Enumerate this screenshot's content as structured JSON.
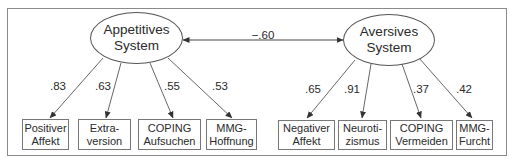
{
  "diagram": {
    "type": "structural-equation-model",
    "correlation": {
      "label": "−.60",
      "between": [
        "Appetitives System",
        "Aversives System"
      ]
    },
    "latents": [
      {
        "name": "Appetitives System",
        "line1": "Appetitives",
        "line2": "System",
        "indicators": [
          {
            "line1": "Positiver",
            "line2": "Affekt",
            "loading": ".83"
          },
          {
            "line1": "Extra-",
            "line2": "version",
            "loading": ".63"
          },
          {
            "line1": "COPING",
            "line2": "Aufsuchen",
            "loading": ".55"
          },
          {
            "line1": "MMG-",
            "line2": "Hoffnung",
            "loading": ".53"
          }
        ]
      },
      {
        "name": "Aversives System",
        "line1": "Aversives",
        "line2": "System",
        "indicators": [
          {
            "line1": "Negativer",
            "line2": "Affekt",
            "loading": ".65"
          },
          {
            "line1": "Neuroti-",
            "line2": "zismus",
            "loading": ".91"
          },
          {
            "line1": "COPING",
            "line2": "Vermeiden",
            "loading": ".37"
          },
          {
            "line1": "MMG-",
            "line2": "Furcht",
            "loading": ".42"
          }
        ]
      }
    ],
    "colors": {
      "line": "#555555",
      "text": "#2a2a2a",
      "frame": "#8a8a8a"
    }
  }
}
